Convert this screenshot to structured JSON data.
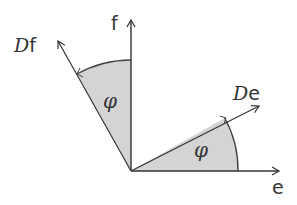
{
  "diagram": {
    "axes": {
      "e_label": "e",
      "f_label": "f"
    },
    "vectors": {
      "De_prefix": "D",
      "De_suffix": "e",
      "Df_prefix": "D",
      "Df_suffix": "f"
    },
    "angles": {
      "lower_angle_label": "φ",
      "upper_angle_label": "φ"
    },
    "colors": {
      "stroke": "#333333",
      "fill": "#d4d4d4"
    }
  }
}
